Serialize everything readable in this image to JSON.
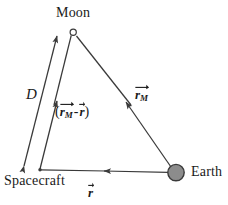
{
  "figure": {
    "type": "vector-diagram",
    "title": "",
    "background_color": "#ffffff",
    "line_color": "#3a3a3a",
    "text_color": "#1a1a1a",
    "earth_fill_color": "#8c8c8c",
    "width": 228,
    "height": 205
  },
  "nodes": [
    {
      "id": "moon",
      "label": "Moon",
      "x": 73,
      "y": 32,
      "marker": "open-circle",
      "radius": 3.2
    },
    {
      "id": "spacecraft",
      "label": "Spacecraft",
      "x": 40,
      "y": 170,
      "marker": "small-dot",
      "radius": 1.6
    },
    {
      "id": "earth",
      "label": "Earth",
      "x": 176,
      "y": 173,
      "marker": "filled-circle",
      "radius": 8.2
    }
  ],
  "vectors": [
    {
      "id": "d",
      "label": "D",
      "label_parts": {
        "symbol": "D",
        "subscript": "",
        "arrow": false
      },
      "from": "spacecraft",
      "to": "moon",
      "arrowheads": "both",
      "style": "double-headed-distance"
    },
    {
      "id": "rm_minus_r",
      "label": "(r_M - r)",
      "label_parts": {
        "open": "(",
        "symbol1": "r",
        "subscript1": "M",
        "minus": "-",
        "symbol2": "r",
        "close": ")",
        "arrow": true
      },
      "from": "spacecraft",
      "to": "moon",
      "arrowheads": "mid",
      "style": "vector"
    },
    {
      "id": "rm",
      "label": "r_M",
      "label_parts": {
        "symbol": "r",
        "subscript": "M",
        "arrow": true
      },
      "from": "earth",
      "to": "moon",
      "arrowheads": "mid",
      "style": "vector"
    },
    {
      "id": "r",
      "label": "r",
      "label_parts": {
        "symbol": "r",
        "subscript": "",
        "arrow": true
      },
      "from": "earth",
      "to": "spacecraft",
      "arrowheads": "mid",
      "style": "vector"
    }
  ],
  "labels": {
    "moon": "Moon",
    "earth": "Earth",
    "spacecraft": "Spacecraft",
    "d": "D",
    "r_symbol": "r",
    "m_subscript": "M",
    "open_paren": "(",
    "close_paren": ")",
    "minus_sign": "-"
  }
}
